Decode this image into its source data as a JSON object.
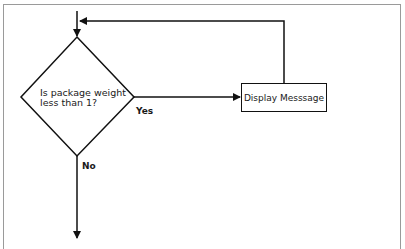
{
  "diagram": {
    "type": "flowchart",
    "decision": {
      "line1": "Is package weight",
      "line2": "less than 1?"
    },
    "process": {
      "label": "Display Messsage"
    },
    "edges": {
      "yes_label": "Yes",
      "no_label": "No"
    },
    "colors": {
      "stroke": "#111111",
      "frame": "#9a9a9a",
      "background": "#ffffff"
    }
  }
}
